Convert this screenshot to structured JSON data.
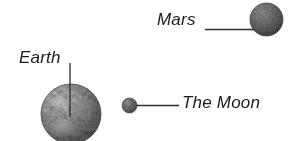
{
  "figure": {
    "background_color": "#ffffff",
    "width": 297,
    "height": 141,
    "text_color": "#1a1a1a",
    "leader_line_color": "#2b2b2b"
  },
  "bodies": [
    {
      "id": "mars",
      "label": "Mars",
      "cx": 266.5,
      "cy": 19.5,
      "r": 16.5,
      "base_color": "#8c8c8c",
      "shadow_color": "#3a3a3a",
      "highlight_color": "#b4b4b4"
    },
    {
      "id": "earth",
      "label": "Earth",
      "cx": 71,
      "cy": 114,
      "r": 30,
      "base_color": "#9b9b9b",
      "shadow_color": "#404040",
      "highlight_color": "#e2e2e2"
    },
    {
      "id": "moon",
      "label": "The Moon",
      "cx": 129.5,
      "cy": 105.5,
      "r": 7.5,
      "base_color": "#8f8f8f",
      "shadow_color": "#3c3c3c",
      "highlight_color": "#bdbdbd"
    }
  ],
  "labels": {
    "mars": "Mars",
    "earth": "Earth",
    "moon": "The Moon"
  },
  "leader_lines": [
    {
      "id": "mars-leader",
      "x1": 205,
      "y1": 29.5,
      "x2": 254,
      "y2": 29.5
    },
    {
      "id": "earth-leader",
      "x1": 70,
      "y1": 63,
      "x2": 70,
      "y2": 117
    },
    {
      "id": "moon-leader",
      "x1": 137,
      "y1": 105.5,
      "x2": 179,
      "y2": 105.5
    }
  ]
}
